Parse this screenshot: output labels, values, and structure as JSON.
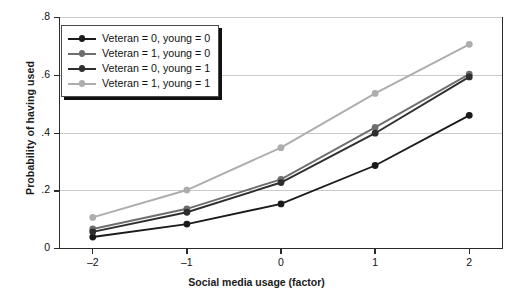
{
  "chart_data": {
    "type": "line",
    "title": "",
    "xlabel": "Social media usage (factor)",
    "ylabel": "Probability of having used",
    "x": [
      -2,
      -1,
      0,
      1,
      2
    ],
    "xticklabels": [
      "–2",
      "–1",
      "0",
      "1",
      "2"
    ],
    "yticklabels": [
      "0",
      ".2",
      ".4",
      ".6",
      ".8"
    ],
    "yticks": [
      0,
      0.2,
      0.4,
      0.6,
      0.8
    ],
    "xlim": [
      -2.35,
      2.35
    ],
    "ylim": [
      0,
      0.8
    ],
    "grid": "horizontal",
    "legend_position": "top-left",
    "series": [
      {
        "name": "Veteran = 0, young = 0",
        "color": "#1a1a1a",
        "values": [
          0.04,
          0.085,
          0.155,
          0.288,
          0.462
        ]
      },
      {
        "name": "Veteran = 1, young = 0",
        "color": "#6e6e6e",
        "values": [
          0.068,
          0.138,
          0.24,
          0.42,
          0.605
        ]
      },
      {
        "name": "Veteran = 0, young = 1",
        "color": "#2e2e2e",
        "values": [
          0.058,
          0.126,
          0.229,
          0.4,
          0.595
        ]
      },
      {
        "name": "Veteran = 1, young = 1",
        "color": "#adadad",
        "values": [
          0.108,
          0.203,
          0.35,
          0.538,
          0.708
        ]
      }
    ]
  },
  "axes": {
    "y_title": "Probability of having used",
    "x_title": "Social media usage (factor)"
  }
}
